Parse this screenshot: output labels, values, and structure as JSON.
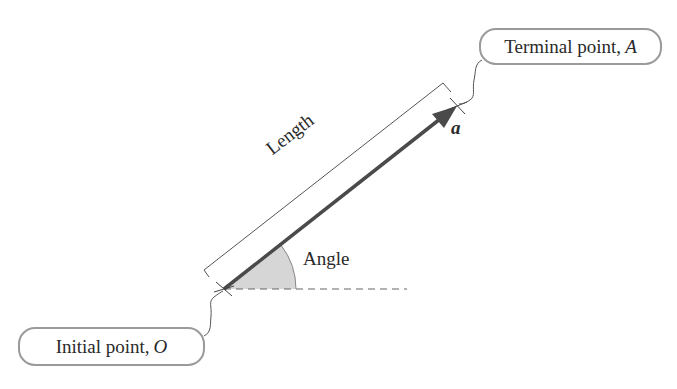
{
  "diagram": {
    "labels": {
      "terminal_point": {
        "text": "Terminal point, ",
        "symbol": "A"
      },
      "initial_point": {
        "text": "Initial point, ",
        "symbol": "O"
      },
      "length": "Length",
      "angle": "Angle",
      "vector": "a"
    },
    "geometry": {
      "origin": [
        224,
        289
      ],
      "terminal": [
        457,
        106
      ],
      "angle_arc_radius": 72,
      "reference_line_end_x": 407
    },
    "colors": {
      "vector": "#4a4a4a",
      "angle_fill": "#d6d6d6",
      "box_border": "#9a9a9a",
      "text": "#2a2a2a",
      "thin_lines": "#555555"
    }
  }
}
